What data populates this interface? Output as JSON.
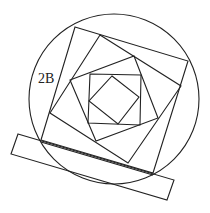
{
  "diagram": {
    "label": "2B",
    "label_pos": {
      "x": 38,
      "y": 83
    },
    "stroke_color": "#222222",
    "background": "#ffffff",
    "circle": {
      "cx": 114,
      "cy": 99,
      "r": 85
    },
    "base_rectangle": {
      "points": "18,134 174,180 167,200 11,154"
    },
    "base_inner_line": {
      "points": "41,142 153,175"
    },
    "squares": [
      {
        "name": "outer-square",
        "points": "75,27 188,61 153,173 41,140"
      },
      {
        "name": "second-square",
        "points": "100,35 181,86 128,163 50,113"
      },
      {
        "name": "third-square",
        "points": "70,80 134,56 158,118 96,141"
      },
      {
        "name": "inner-square",
        "points": "90,74 141,75 140,125 88,123"
      },
      {
        "name": "innermost-diamond",
        "points": "112,76 139,97 118,124 89,101"
      }
    ]
  }
}
